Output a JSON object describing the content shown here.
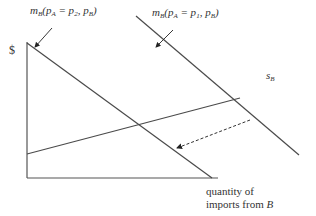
{
  "diagram": {
    "y_axis_label": "$",
    "x_axis_label_line1": "quantity of",
    "x_axis_label_line2_prefix": "imports from ",
    "x_axis_label_line2_var": "B",
    "curves": [
      {
        "id": "mB_p2",
        "label_m": "m",
        "label_m_sub": "B",
        "label_open": "(p",
        "label_a_sub": "A",
        "label_eq": " = p",
        "label_val_sub": "2",
        "label_sep": ", p",
        "label_b_sub": "B",
        "label_close": ")"
      },
      {
        "id": "mB_p1",
        "label_m": "m",
        "label_m_sub": "B",
        "label_open": "(p",
        "label_a_sub": "A",
        "label_eq": " = p",
        "label_val_sub": "1",
        "label_sep": ", p",
        "label_b_sub": "B",
        "label_close": ")"
      },
      {
        "id": "sB",
        "label_s": "s",
        "label_s_sub": "B"
      }
    ],
    "line_color": "#4a4a4a"
  }
}
